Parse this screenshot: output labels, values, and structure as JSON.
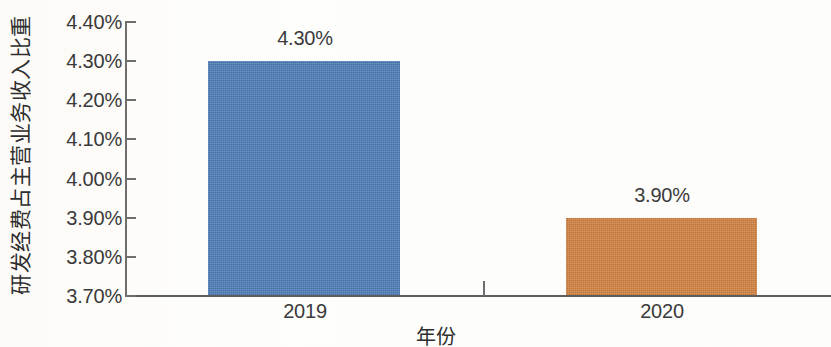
{
  "chart_data": {
    "type": "bar",
    "title": "",
    "xlabel": "年份",
    "ylabel": "研发经费占主营业务收入比重",
    "categories": [
      "2019",
      "2020"
    ],
    "values": [
      4.3,
      3.9
    ],
    "value_labels": [
      "4.30%",
      "3.90%"
    ],
    "series": [
      {
        "name": "研发经费占主营业务收入比重",
        "values": [
          4.3,
          3.9
        ],
        "colors": [
          "#4a79b4",
          "#cf7f3e"
        ]
      }
    ],
    "ylim": [
      3.7,
      4.4
    ],
    "ytick_values": [
      4.4,
      4.3,
      4.2,
      4.1,
      4.0,
      3.9,
      3.8,
      3.7
    ],
    "ytick_labels": [
      "4.40%",
      "4.30%",
      "4.20%",
      "4.10%",
      "4.00%",
      "3.90%",
      "3.80%",
      "3.70%"
    ],
    "grid": false,
    "legend": "none",
    "colors": {
      "bar_2019": "#4a79b4",
      "bar_2020": "#cf7f3e",
      "axis": "#6e6e6e",
      "text": "#3a3a3a",
      "background": "#fdfdfb"
    }
  },
  "axis": {
    "y_title": "研发经费占主营业务收入比重",
    "x_title": "年份",
    "ticks": [
      {
        "label": "4.40%",
        "value": 4.4
      },
      {
        "label": "4.30%",
        "value": 4.3
      },
      {
        "label": "4.20%",
        "value": 4.2
      },
      {
        "label": "4.10%",
        "value": 4.1
      },
      {
        "label": "4.00%",
        "value": 4.0
      },
      {
        "label": "3.90%",
        "value": 3.9
      },
      {
        "label": "3.80%",
        "value": 3.8
      },
      {
        "label": "3.70%",
        "value": 3.7
      }
    ]
  },
  "bars": [
    {
      "category": "2019",
      "value_label": "4.30%",
      "value": 4.3,
      "color": "#4a79b4"
    },
    {
      "category": "2020",
      "value_label": "3.90%",
      "value": 3.9,
      "color": "#cf7f3e"
    }
  ]
}
